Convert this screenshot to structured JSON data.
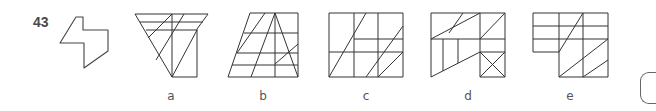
{
  "question": {
    "number": "43",
    "prompt_shape": "zigzag-hexagon-outline"
  },
  "options": [
    {
      "label": "a",
      "description": "inverted trapezoid-triangle composite with grid and diagonals"
    },
    {
      "label": "b",
      "description": "trapezoid with horizontal bands and diagonal lines"
    },
    {
      "label": "c",
      "description": "square grid with diagonal lines"
    },
    {
      "label": "d",
      "description": "irregular polygon with boxed X in lower right"
    },
    {
      "label": "e",
      "description": "L-shaped grid with diagonals"
    }
  ],
  "answer_box": {
    "visible_fragment": "("
  },
  "colors": {
    "stroke": "#333333",
    "text": "#555555",
    "question_number": "#4a4a4a"
  }
}
